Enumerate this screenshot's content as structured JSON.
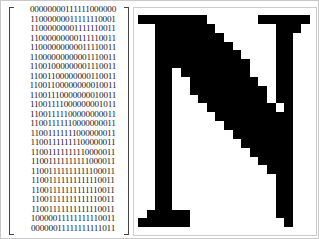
{
  "bitmap": {
    "rows": [
      "00000000111111000000",
      "11000000011111110001",
      "11000000001111110011",
      "11000000000111110011",
      "11000000000011110011",
      "11000000000001110011",
      "11001000000001110011",
      "11001100000000110011",
      "11001100000000010011",
      "11001110000000010011",
      "11001111000000001011",
      "11001111100000000011",
      "11001111110000000011",
      "11001111111000000011",
      "11001111111100000011",
      "11001111111110000011",
      "11001111111111000011",
      "11001111111111100011",
      "11001111111111110011",
      "11001111111111110011",
      "11001111111111110011",
      "11001111111111110011",
      "10000011111111110011",
      "00000011111111111011"
    ]
  },
  "glyph": {
    "letter": "N",
    "fill_color": "#000000",
    "background_color": "#ffffff"
  }
}
